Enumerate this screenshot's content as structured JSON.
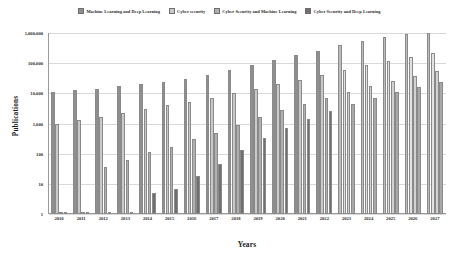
{
  "chart_data": {
    "type": "bar",
    "title": "",
    "xlabel": "Years",
    "ylabel": "Publications",
    "yscale": "log",
    "ylim": [
      1,
      1000000
    ],
    "ytick_labels": [
      "1,000,000",
      "100,000",
      "10,000",
      "1,000",
      "100",
      "10",
      "1"
    ],
    "ytick_values": [
      1000000,
      100000,
      10000,
      1000,
      100,
      10,
      1
    ],
    "grid": true,
    "legend_position": "top-center",
    "categories": [
      "2010",
      "2011",
      "2012",
      "2013",
      "2014",
      "2015",
      "2016",
      "2017",
      "2018",
      "2019",
      "2020",
      "2021",
      "2022",
      "2023",
      "2024",
      "2025",
      "2026",
      "2027"
    ],
    "forecast_categories": [
      "2023",
      "2024",
      "2025",
      "2026",
      "2027"
    ],
    "series": [
      {
        "name": "Machine Learning and Deep Learning",
        "color": "#8f8f8f",
        "values": [
          11000,
          12500,
          14000,
          17000,
          20000,
          24000,
          30000,
          40000,
          60000,
          85000,
          130000,
          190000,
          260000,
          400000,
          560000,
          760000,
          900000,
          980000
        ]
      },
      {
        "name": "Cyber security",
        "color": "#c9c9c9",
        "values": [
          1000,
          1300,
          1700,
          2300,
          3000,
          4000,
          5200,
          7000,
          10000,
          14000,
          20000,
          28000,
          40000,
          60000,
          85000,
          120000,
          165000,
          220000
        ]
      },
      {
        "name": "Cyber Security and Machine Learning",
        "color": "#b0b0b0",
        "values": [
          1,
          1,
          35,
          60,
          110,
          170,
          300,
          500,
          900,
          1600,
          2800,
          4500,
          7000,
          11000,
          17000,
          26000,
          38000,
          55000
        ]
      },
      {
        "name": "Cyber Security and Deep Learning",
        "color": "#6f6f6f",
        "values": [
          1,
          1,
          1,
          1,
          5,
          7,
          18,
          45,
          130,
          330,
          700,
          1400,
          2600,
          4400,
          7000,
          11000,
          16000,
          23000
        ]
      }
    ]
  },
  "legend": {
    "items": [
      {
        "label": "Machine Learning and Deep Learning"
      },
      {
        "label": "Cyber security"
      },
      {
        "label": "Cyber Security and Machine Learning"
      },
      {
        "label": "Cyber Security and Deep Learning"
      }
    ]
  },
  "axes": {
    "y_title": "Publications",
    "x_title": "Years"
  }
}
